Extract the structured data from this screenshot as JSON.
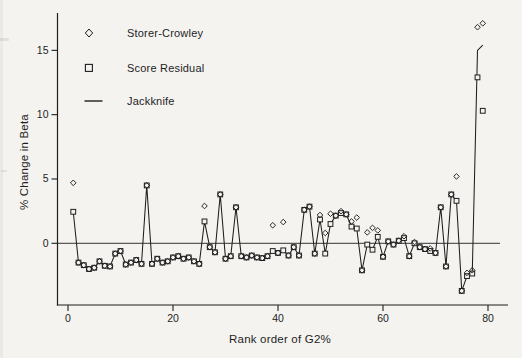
{
  "figure": {
    "background": "#f4f3f0",
    "ink": "#1e1e1e"
  },
  "legend": {
    "items": [
      {
        "label": "Storer-Crowley",
        "marker": "diamond"
      },
      {
        "label": "Score Residual",
        "marker": "square"
      },
      {
        "label": "Jackknife",
        "marker": "line"
      }
    ]
  },
  "axes": {
    "xlabel": "Rank order of G2%",
    "ylabel": "% Change in Beta",
    "yticks": [
      0,
      5,
      10,
      15
    ],
    "xticks": [
      0,
      20,
      40,
      60,
      80
    ]
  },
  "chart_data": {
    "type": "line",
    "title": "",
    "xlabel": "Rank order of G2%",
    "ylabel": "% Change in Beta",
    "xlim": [
      0,
      82
    ],
    "ylim": [
      -4.8,
      17.9
    ],
    "x_rule": "rank = series index + 1 (ranks 1-79)",
    "legend_position": "top-left inside plot",
    "grid": false,
    "zero_reference_line": true,
    "series": [
      {
        "name": "Storer-Crowley",
        "marker": "diamond",
        "line": false,
        "values": [
          4.7,
          -1.5,
          -1.7,
          -2.0,
          -1.9,
          -1.4,
          -1.75,
          -1.8,
          -0.8,
          -0.6,
          -1.65,
          -1.5,
          -1.3,
          -1.6,
          4.5,
          -1.6,
          -1.2,
          -1.5,
          -1.4,
          -1.1,
          -1.0,
          -1.2,
          -1.1,
          -1.4,
          -1.6,
          2.9,
          -0.3,
          -0.7,
          3.8,
          -1.2,
          -1.0,
          2.8,
          -1.0,
          -1.1,
          -0.95,
          -1.1,
          -1.15,
          -1.0,
          1.4,
          -0.75,
          1.65,
          -0.95,
          -0.3,
          -0.95,
          2.6,
          2.85,
          -0.8,
          2.2,
          0.8,
          2.3,
          2.15,
          2.5,
          2.25,
          1.7,
          2.0,
          -2.1,
          0.85,
          1.2,
          1.0,
          -1.05,
          0.15,
          -0.1,
          0.2,
          0.55,
          -1.0,
          0.1,
          -0.3,
          -0.45,
          -0.4,
          -0.75,
          2.8,
          -1.8,
          3.8,
          5.2,
          -3.7,
          -2.3,
          -2.1,
          16.8,
          17.1
        ]
      },
      {
        "name": "Score Residual",
        "marker": "square",
        "line": false,
        "values": [
          2.45,
          -1.5,
          -1.7,
          -2.0,
          -1.9,
          -1.4,
          -1.75,
          -1.8,
          -0.8,
          -0.6,
          -1.65,
          -1.5,
          -1.3,
          -1.6,
          4.5,
          -1.6,
          -1.2,
          -1.5,
          -1.4,
          -1.1,
          -1.0,
          -1.2,
          -1.1,
          -1.4,
          -1.6,
          1.7,
          -0.3,
          -0.7,
          3.8,
          -1.2,
          -1.0,
          2.8,
          -1.0,
          -1.1,
          -0.95,
          -1.1,
          -1.15,
          -1.0,
          -0.6,
          -0.75,
          -0.55,
          -0.95,
          -0.3,
          -0.95,
          2.6,
          2.85,
          -0.8,
          1.85,
          -0.8,
          1.5,
          2.15,
          2.35,
          2.25,
          1.3,
          1.15,
          -2.1,
          -0.1,
          -0.5,
          0.5,
          -1.05,
          0.15,
          -0.1,
          0.2,
          0.4,
          -1.0,
          0.0,
          -0.3,
          -0.45,
          -0.6,
          -0.75,
          2.8,
          -1.8,
          3.8,
          3.3,
          -3.7,
          -2.55,
          -2.35,
          12.9,
          10.3
        ]
      },
      {
        "name": "Jackknife",
        "marker": "none",
        "line": true,
        "values": [
          2.45,
          -1.5,
          -1.7,
          -2.0,
          -1.9,
          -1.4,
          -1.75,
          -1.8,
          -0.8,
          -0.6,
          -1.65,
          -1.5,
          -1.3,
          -1.6,
          4.5,
          -1.6,
          -1.2,
          -1.5,
          -1.4,
          -1.1,
          -1.0,
          -1.2,
          -1.1,
          -1.4,
          -1.6,
          1.7,
          -0.3,
          -0.7,
          3.8,
          -1.2,
          -1.0,
          2.8,
          -1.0,
          -1.1,
          -0.95,
          -1.1,
          -1.15,
          -1.0,
          -0.6,
          -0.75,
          -0.55,
          -0.95,
          -0.3,
          -0.95,
          2.6,
          2.85,
          -0.8,
          1.85,
          -0.8,
          1.5,
          2.15,
          2.35,
          2.25,
          1.3,
          1.15,
          -2.1,
          -0.1,
          -0.5,
          0.5,
          -1.05,
          0.15,
          -0.1,
          0.2,
          0.4,
          -1.0,
          0.0,
          -0.3,
          -0.45,
          -0.6,
          -0.75,
          2.8,
          -1.8,
          3.8,
          3.3,
          -3.7,
          -2.55,
          -2.35,
          15.0,
          15.4
        ]
      }
    ]
  }
}
